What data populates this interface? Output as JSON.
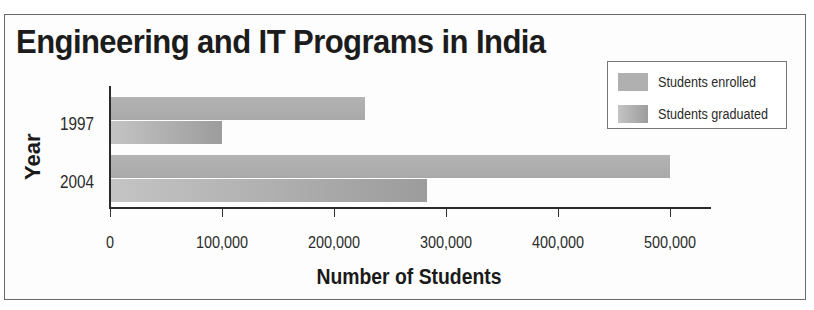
{
  "chart_data": {
    "type": "bar",
    "orientation": "horizontal",
    "title": "Engineering and IT Programs in India",
    "xlabel": "Number of Students",
    "ylabel": "Year",
    "categories": [
      "1997",
      "2004"
    ],
    "series": [
      {
        "name": "Students enrolled",
        "values": [
          228000,
          500000
        ],
        "color": "#b0b0b0"
      },
      {
        "name": "Students graduated",
        "values": [
          100000,
          283000
        ],
        "color": "#a6a6a6"
      }
    ],
    "xlim": [
      0,
      535000
    ],
    "xticks": [
      0,
      100000,
      200000,
      300000,
      400000,
      500000
    ],
    "xtick_labels": [
      "0",
      "100,000",
      "200,000",
      "300,000",
      "400,000",
      "500,000"
    ],
    "grid": false,
    "legend_position": "upper right"
  },
  "chart": {
    "title": "Engineering and IT Programs in India",
    "xlabel": "Number of Students",
    "ylabel": "Year",
    "categories": [
      "1997",
      "2004"
    ],
    "xtick_labels": [
      "0",
      "100,000",
      "200,000",
      "300,000",
      "400,000",
      "500,000"
    ],
    "legend": [
      "Students enrolled",
      "Students graduated"
    ]
  }
}
